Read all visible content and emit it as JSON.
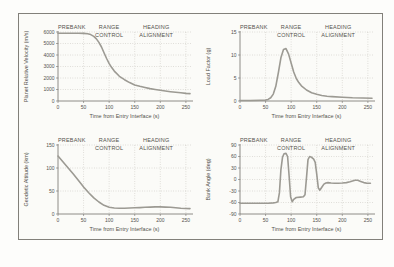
{
  "colors": {
    "curve": "#9c9a93",
    "grid": "#b9b5ac",
    "axis": "#73716b",
    "text": "#54524d",
    "frame": "#82807a",
    "background": "#fbfbf8"
  },
  "chart_data": [
    {
      "id": "planet-relative-velocity",
      "type": "line",
      "title": "",
      "xlabel": "Time from Entry Interface (s)",
      "ylabel": "Planet Relative Velocity (m/s)",
      "xlim": [
        0,
        260
      ],
      "ylim": [
        0,
        6000
      ],
      "xticks": [
        0,
        50,
        100,
        150,
        200,
        250
      ],
      "yticks": [
        0,
        1000,
        2000,
        3000,
        4000,
        5000,
        6000
      ],
      "grid": "dotted",
      "legend": "none",
      "phases": [
        {
          "x": 27,
          "lines": [
            "PREBANK"
          ]
        },
        {
          "x": 100,
          "lines": [
            "RANGE",
            "CONTROL"
          ]
        },
        {
          "x": 192,
          "lines": [
            "HEADING",
            "ALIGNMENT"
          ]
        }
      ],
      "x": [
        0,
        10,
        20,
        30,
        40,
        50,
        58,
        64,
        70,
        75,
        80,
        85,
        90,
        95,
        100,
        105,
        110,
        120,
        130,
        140,
        150,
        160,
        170,
        180,
        190,
        200,
        210,
        220,
        230,
        240,
        250,
        258
      ],
      "y": [
        5900,
        5900,
        5900,
        5900,
        5890,
        5880,
        5850,
        5770,
        5620,
        5400,
        5100,
        4700,
        4200,
        3700,
        3250,
        2900,
        2600,
        2150,
        1850,
        1600,
        1400,
        1280,
        1170,
        1080,
        1000,
        930,
        870,
        810,
        760,
        710,
        660,
        640
      ]
    },
    {
      "id": "load-factor",
      "type": "line",
      "title": "",
      "xlabel": "Time from Entry Interface (s)",
      "ylabel": "Load Factor (g)",
      "xlim": [
        0,
        260
      ],
      "ylim": [
        0,
        15
      ],
      "xticks": [
        0,
        50,
        100,
        150,
        200,
        250
      ],
      "yticks": [
        0,
        5,
        10,
        15
      ],
      "grid": "dotted",
      "legend": "none",
      "phases": [
        {
          "x": 27,
          "lines": [
            "PREBANK"
          ]
        },
        {
          "x": 100,
          "lines": [
            "RANGE",
            "CONTROL"
          ]
        },
        {
          "x": 192,
          "lines": [
            "HEADING",
            "ALIGNMENT"
          ]
        }
      ],
      "x": [
        0,
        20,
        40,
        50,
        55,
        60,
        65,
        70,
        75,
        80,
        85,
        90,
        95,
        100,
        105,
        110,
        115,
        120,
        130,
        140,
        150,
        160,
        170,
        180,
        200,
        220,
        240,
        258
      ],
      "y": [
        0.1,
        0.1,
        0.15,
        0.2,
        0.35,
        0.7,
        1.5,
        3.2,
        6.2,
        9.4,
        11.2,
        11.4,
        10.2,
        8.2,
        6.3,
        4.9,
        4.0,
        3.3,
        2.4,
        1.8,
        1.45,
        1.2,
        1.05,
        0.95,
        0.8,
        0.7,
        0.65,
        0.6
      ]
    },
    {
      "id": "geodetic-altitude",
      "type": "line",
      "title": "",
      "xlabel": "Time from Entry Interface (s)",
      "ylabel": "Geodetic Altitude (km)",
      "xlim": [
        0,
        260
      ],
      "ylim": [
        0,
        150
      ],
      "xticks": [
        0,
        50,
        100,
        150,
        200,
        250
      ],
      "yticks": [
        0,
        50,
        100,
        150
      ],
      "grid": "dotted",
      "legend": "none",
      "phases": [
        {
          "x": 27,
          "lines": [
            "PREBANK"
          ]
        },
        {
          "x": 100,
          "lines": [
            "RANGE",
            "CONTROL"
          ]
        },
        {
          "x": 192,
          "lines": [
            "HEADING",
            "ALIGNMENT"
          ]
        }
      ],
      "x": [
        0,
        10,
        20,
        30,
        40,
        50,
        60,
        70,
        80,
        90,
        100,
        110,
        120,
        130,
        140,
        150,
        160,
        170,
        180,
        190,
        200,
        210,
        220,
        230,
        240,
        250,
        258
      ],
      "y": [
        126,
        113,
        100,
        87,
        73,
        59,
        46,
        35,
        26,
        19,
        14.5,
        13,
        12.5,
        12.5,
        13,
        13.5,
        14,
        14.5,
        15,
        15.5,
        15.5,
        15,
        14.5,
        13.5,
        12.5,
        12,
        11.8
      ]
    },
    {
      "id": "bank-angle",
      "type": "line",
      "title": "",
      "xlabel": "Time from Entry Interface (s)",
      "ylabel": "Bank Angle (deg)",
      "xlim": [
        0,
        260
      ],
      "ylim": [
        -90,
        90
      ],
      "xticks": [
        0,
        50,
        100,
        150,
        200,
        250
      ],
      "yticks": [
        -90,
        -60,
        -30,
        0,
        30,
        60,
        90
      ],
      "grid": "dotted",
      "legend": "none",
      "phases": [
        {
          "x": 27,
          "lines": [
            "PREBANK"
          ]
        },
        {
          "x": 100,
          "lines": [
            "RANGE",
            "CONTROL"
          ]
        },
        {
          "x": 192,
          "lines": [
            "HEADING",
            "ALIGNMENT"
          ]
        }
      ],
      "x": [
        0,
        20,
        40,
        55,
        65,
        70,
        74,
        77,
        80,
        83,
        86,
        90,
        93,
        96,
        99,
        102,
        105,
        110,
        118,
        124,
        127,
        130,
        133,
        136,
        140,
        144,
        147,
        150,
        153,
        156,
        160,
        164,
        168,
        172,
        178,
        185,
        192,
        200,
        208,
        215,
        220,
        225,
        230,
        236,
        242,
        248,
        255
      ],
      "y": [
        -62,
        -62,
        -62,
        -62,
        -61,
        -60,
        -58,
        -35,
        25,
        58,
        67,
        68,
        60,
        10,
        -45,
        -58,
        -52,
        -47,
        -46,
        -45,
        -40,
        5,
        52,
        60,
        58,
        53,
        45,
        15,
        -22,
        -28,
        -20,
        -12,
        -9,
        -8,
        -9,
        -10,
        -10,
        -9,
        -8,
        -6,
        -4,
        -2,
        -2,
        -5,
        -8,
        -10,
        -10
      ]
    }
  ]
}
